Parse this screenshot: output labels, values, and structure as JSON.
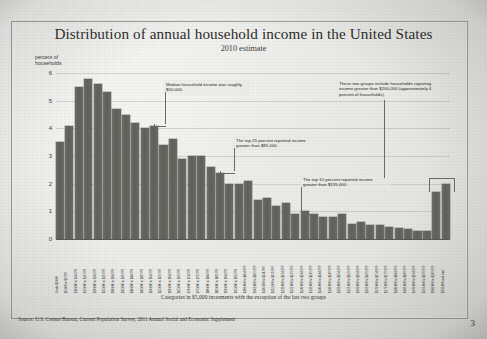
{
  "page": {
    "number": "3"
  },
  "chart_data": {
    "type": "bar",
    "title": "Distribution of annual household income in the United States",
    "subtitle": "2010 estimate",
    "ylabel": "percent of\nhouseholds",
    "ylabel_line1": "percent of",
    "ylabel_line2": "households",
    "xlabel": "Categories in $5,000 increments with the exception of the last two groups",
    "ylim": [
      0,
      6
    ],
    "yticks": [
      "6",
      "5",
      "4",
      "3",
      "2",
      "1",
      "0"
    ],
    "grid": true,
    "legend": "none",
    "source": "Source: U.S. Census Bureau, Current Population Survey, 2011 Annual Social and Economic Supplement",
    "categories": [
      "Under $5,000",
      "$5,000 to $9,999",
      "$10,000 to $14,999",
      "$15,000 to $19,999",
      "$20,000 to $24,999",
      "$25,000 to $29,999",
      "$30,000 to $34,999",
      "$35,000 to $39,999",
      "$40,000 to $44,999",
      "$45,000 to $49,999",
      "$50,000 to $54,999",
      "$55,000 to $59,999",
      "$60,000 to $64,999",
      "$65,000 to $69,999",
      "$70,000 to $74,999",
      "$75,000 to $79,999",
      "$80,000 to $84,999",
      "$85,000 to $89,999",
      "$90,000 to $94,999",
      "$95,000 to $99,999",
      "$100,000 to $104,999",
      "$105,000 to $109,999",
      "$110,000 to $114,999",
      "$115,000 to $119,999",
      "$120,000 to $124,999",
      "$125,000 to $129,999",
      "$130,000 to $134,999",
      "$135,000 to $139,999",
      "$140,000 to $144,999",
      "$145,000 to $149,999",
      "$150,000 to $154,999",
      "$155,000 to $159,999",
      "$160,000 to $164,999",
      "$165,000 to $169,999",
      "$170,000 to $174,999",
      "$175,000 to $179,999",
      "$180,000 to $184,999",
      "$185,000 to $189,999",
      "$190,000 to $194,999",
      "$195,000 to $199,999",
      "$200,000 to $249,999",
      "$250,000 and over"
    ],
    "values": [
      3.5,
      4.1,
      5.5,
      5.8,
      5.6,
      5.3,
      4.7,
      4.5,
      4.2,
      4.0,
      4.1,
      3.4,
      3.6,
      2.9,
      3.0,
      3.0,
      2.6,
      2.4,
      2.0,
      2.0,
      2.1,
      1.4,
      1.5,
      1.2,
      1.3,
      0.9,
      1.0,
      0.9,
      0.8,
      0.8,
      0.9,
      0.55,
      0.6,
      0.5,
      0.5,
      0.45,
      0.4,
      0.35,
      0.3,
      0.3,
      1.7,
      2.0
    ],
    "annotations": [
      {
        "id": "median",
        "text": "Median household income was roughly $50,000.",
        "target_category": "$50,000 to $54,999"
      },
      {
        "id": "top25",
        "text": "The top 25 percent reported income greater than $85,000.",
        "target_category": "$85,000 to $89,999"
      },
      {
        "id": "top10",
        "text": "The top 10 percent reported income greater than $135,000.",
        "target_category": "$135,000 to $139,999"
      },
      {
        "id": "top-two-groups",
        "text": "These two groups include households reporting income greater than $200,000 (approximately 4 percent of households).",
        "target_category": "$200,000 to $249,999"
      }
    ]
  }
}
